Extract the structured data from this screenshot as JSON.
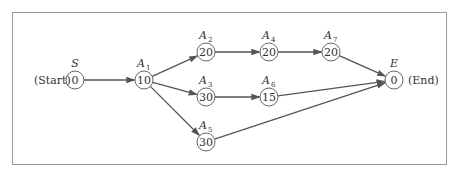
{
  "diagram": {
    "type": "activity-network",
    "start_label": "(Start)",
    "end_label": "(End)",
    "nodes": [
      {
        "id": "S",
        "label": "S",
        "sub": "",
        "value": "0",
        "x": 75,
        "y": 80
      },
      {
        "id": "A1",
        "label": "A",
        "sub": "1",
        "value": "10",
        "x": 144,
        "y": 80
      },
      {
        "id": "A2",
        "label": "A",
        "sub": "2",
        "value": "20",
        "x": 206,
        "y": 52
      },
      {
        "id": "A3",
        "label": "A",
        "sub": "3",
        "value": "30",
        "x": 206,
        "y": 97
      },
      {
        "id": "A5",
        "label": "A",
        "sub": "5",
        "value": "30",
        "x": 206,
        "y": 142
      },
      {
        "id": "A4",
        "label": "A",
        "sub": "4",
        "value": "20",
        "x": 269,
        "y": 52
      },
      {
        "id": "A6",
        "label": "A",
        "sub": "6",
        "value": "15",
        "x": 269,
        "y": 97
      },
      {
        "id": "A7",
        "label": "A",
        "sub": "7",
        "value": "20",
        "x": 331,
        "y": 52
      },
      {
        "id": "E",
        "label": "E",
        "sub": "",
        "value": "0",
        "x": 394,
        "y": 80
      }
    ],
    "edges": [
      [
        "S",
        "A1"
      ],
      [
        "A1",
        "A2"
      ],
      [
        "A1",
        "A3"
      ],
      [
        "A1",
        "A5"
      ],
      [
        "A2",
        "A4"
      ],
      [
        "A4",
        "A7"
      ],
      [
        "A7",
        "E"
      ],
      [
        "A3",
        "A6"
      ],
      [
        "A6",
        "E"
      ],
      [
        "A5",
        "E"
      ]
    ]
  }
}
